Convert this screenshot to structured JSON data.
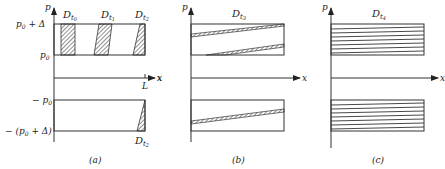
{
  "figure": {
    "panels": [
      {
        "id": "a",
        "caption": "(a)",
        "axis_labels": {
          "y": "p",
          "x": "x"
        },
        "ticks": {
          "y_top_upper": "p₀ + Δ",
          "y_top_lower": "p₀",
          "y_bottom_upper": "−p₀",
          "y_bottom_lower": "−(p₀ + Δ)",
          "x_end": "L"
        },
        "regions": [
          {
            "label": "D",
            "subscript": "t₀"
          },
          {
            "label": "D",
            "subscript": "t₁"
          },
          {
            "label": "D",
            "subscript": "t₂"
          },
          {
            "label": "D",
            "subscript": "t₂",
            "position": "bottom"
          }
        ]
      },
      {
        "id": "b",
        "caption": "(b)",
        "axis_labels": {
          "y": "p",
          "x": "x"
        },
        "regions": [
          {
            "label": "D",
            "subscript": "t₃"
          }
        ]
      },
      {
        "id": "c",
        "caption": "(c)",
        "axis_labels": {
          "y": "p",
          "x": "x"
        },
        "regions": [
          {
            "label": "D",
            "subscript": "t₄"
          }
        ]
      }
    ]
  },
  "text": {
    "a_p": "p",
    "a_x": "x",
    "a_L": "L",
    "a_p0d": "p",
    "a_p0d_sub": "0",
    "a_p0d_rest": " + Δ",
    "a_p0": "p",
    "a_p0_sub": "0",
    "a_mp0": "− p",
    "a_mp0_sub": "0",
    "a_mp0d": "− (p",
    "a_mp0d_sub": "0",
    "a_mp0d_rest": " + Δ)",
    "D": "D",
    "t0": "t",
    "t0s": "0",
    "t1s": "1",
    "t2s": "2",
    "t3s": "3",
    "t4s": "4",
    "cap_a": "(a)",
    "cap_b": "(b)",
    "cap_c": "(c)",
    "b_p": "p",
    "b_x": "x",
    "c_p": "p",
    "c_x": "x"
  }
}
